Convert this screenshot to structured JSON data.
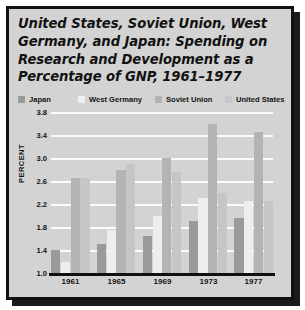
{
  "figure": {
    "title_lines": [
      "United States, Soviet Union, West",
      "Germany, and Japan: Spending on",
      "Research and Development as a",
      "Percentage of GNP, 1961–1977"
    ],
    "source_note": "SOURCE: Data Resources"
  },
  "chart_data": {
    "type": "bar",
    "title": "United States, Soviet Union, West Germany, and Japan: Spending on Research and Development as a Percentage of GNP, 1961–1977",
    "xlabel": "",
    "ylabel": "PERCENT",
    "categories": [
      "1961",
      "1965",
      "1969",
      "1973",
      "1977"
    ],
    "series": [
      {
        "name": "Japan",
        "color": "#9a9a9a",
        "values": [
          1.4,
          1.5,
          1.65,
          1.9,
          1.95
        ]
      },
      {
        "name": "West Germany",
        "color": "#eeeeee",
        "values": [
          1.2,
          1.75,
          2.0,
          2.3,
          2.25
        ]
      },
      {
        "name": "Soviet Union",
        "color": "#b4b4b4",
        "values": [
          2.65,
          2.8,
          3.0,
          3.6,
          3.45
        ]
      },
      {
        "name": "United States",
        "color": "#c6c6c6",
        "values": [
          2.65,
          2.9,
          2.75,
          2.4,
          2.25
        ]
      }
    ],
    "yticks": [
      "1.0",
      "1.4",
      "1.8",
      "2.2",
      "2.6",
      "3.0",
      "3.4",
      "3.8"
    ],
    "ylim": [
      1.0,
      3.8
    ],
    "grid": true,
    "legend_position": "top",
    "gridline_color": "#fbfbfb",
    "background_color": "#d3d3d3"
  }
}
